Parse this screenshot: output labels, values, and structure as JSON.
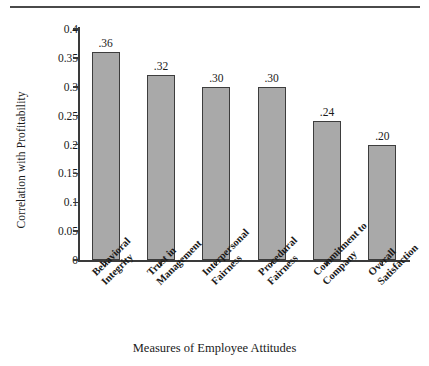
{
  "chart_data": {
    "type": "bar",
    "title": "",
    "categories": [
      "Behavioral Integrity",
      "Trust in Management",
      "Interpersonal Fairness",
      "Procedural Fairness",
      "Commitment to Company",
      "Overall Satisfaction"
    ],
    "category_lines": [
      [
        "Behavioral",
        "Integrity"
      ],
      [
        "Trust in",
        "Management"
      ],
      [
        "Interpersonal",
        "Fairness"
      ],
      [
        "Procedural",
        "Fairness"
      ],
      [
        "Commitment to",
        "Company"
      ],
      [
        "Overall",
        "Satisfaction"
      ]
    ],
    "values": [
      0.36,
      0.32,
      0.3,
      0.3,
      0.24,
      0.2
    ],
    "value_labels": [
      ".36",
      ".32",
      ".30",
      ".30",
      ".24",
      ".20"
    ],
    "xlabel": "Measures of Employee Attitudes",
    "ylabel": "Correlation with Profitability",
    "ylim": [
      0,
      0.4
    ],
    "ytick_labels": [
      "0",
      "0.05",
      "0.1",
      "0.15",
      "0.2",
      "0.25",
      "0.3",
      "0.35",
      "0.4"
    ],
    "ytick_values": [
      0,
      0.05,
      0.1,
      0.15,
      0.2,
      0.25,
      0.3,
      0.35,
      0.4
    ],
    "grid": false,
    "legend": "none",
    "bar_fill_color": "#a9a9a9",
    "bar_border_color": "#3d3d3d",
    "axis_color": "#3a3a3a",
    "text_color": "#1a1a1a"
  }
}
